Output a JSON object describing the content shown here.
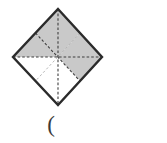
{
  "figure": {
    "caption": "(",
    "colors": {
      "shaded_fill": "#c9c9c9",
      "unshaded_fill": "#ffffff",
      "outline_stroke": "#2b2b2b",
      "crease_strong": "#3f3f3f",
      "crease_faint": "#b0b0b0",
      "caption_color": "#3a3a3a",
      "background": "#ffffff"
    },
    "shape": {
      "name": "square-rotated-45",
      "vertices": {
        "top": {
          "x": 58,
          "y": 9
        },
        "right": {
          "x": 102,
          "y": 57
        },
        "bottom": {
          "x": 58,
          "y": 105
        },
        "left": {
          "x": 13,
          "y": 57
        }
      },
      "center": {
        "x": 58,
        "y": 57
      },
      "outline_width": 2.4
    },
    "sectors": [
      {
        "id": "s1",
        "name": "top-left-upper",
        "points": "58,57 58,9 35.5,33",
        "shaded": true
      },
      {
        "id": "s2",
        "name": "top-left-lower",
        "points": "58,57 35.5,33 13,57",
        "shaded": true
      },
      {
        "id": "s3",
        "name": "top-right-upper",
        "points": "58,57 58,9 80,33",
        "shaded": true
      },
      {
        "id": "s4",
        "name": "top-right-lower",
        "points": "58,57 80,33 102,57",
        "shaded": true
      },
      {
        "id": "s5",
        "name": "bottom-right-upper",
        "points": "58,57 102,57 80,81",
        "shaded": true
      },
      {
        "id": "s6",
        "name": "bottom-right-lower",
        "points": "58,57 80,81 58,105",
        "shaded": false
      },
      {
        "id": "s7",
        "name": "bottom-left-lower",
        "points": "58,57 58,105 35.5,81",
        "shaded": false
      },
      {
        "id": "s8",
        "name": "bottom-left-upper",
        "points": "58,57 35.5,81 13,57",
        "shaded": false
      }
    ],
    "crease_lines": [
      {
        "id": "c1",
        "name": "horizontal-median",
        "x1": 13,
        "y1": 57,
        "x2": 102,
        "y2": 57,
        "style": "dashed",
        "strength": "strong"
      },
      {
        "id": "c2",
        "name": "vertical-median",
        "x1": 58,
        "y1": 9,
        "x2": 58,
        "y2": 105,
        "style": "dashed",
        "strength": "strong"
      },
      {
        "id": "c3",
        "name": "diagonal-tl-br",
        "x1": 35.5,
        "y1": 33,
        "x2": 80,
        "y2": 81,
        "style": "dashed",
        "strength": "strong"
      },
      {
        "id": "c4",
        "name": "diagonal-tr-bl",
        "x1": 80,
        "y1": 33,
        "x2": 35.5,
        "y2": 81,
        "style": "dashed",
        "strength": "faint"
      }
    ]
  }
}
